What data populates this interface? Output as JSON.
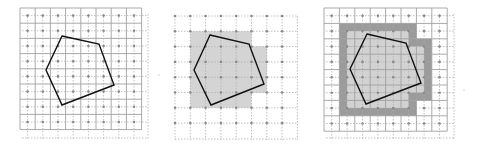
{
  "figure": {
    "colors": {
      "background": "#ffffff",
      "grid_solid": "#9a9a9a",
      "grid_dotted": "#b0b0b0",
      "sample_dot": "#8a8a8a",
      "polygon_stroke": "#111111",
      "fill_light": "#d4d4d4",
      "fill_dark": "#9b9b9b"
    },
    "panels": [
      {
        "id": "panel-1",
        "label": "polygon over grid",
        "origin": [
          20,
          8
        ],
        "cell": 15.2,
        "cols": 8,
        "rows": 8,
        "polygon": [
          [
            62,
            36
          ],
          [
            99,
            44
          ],
          [
            114,
            85
          ],
          [
            62,
            105
          ],
          [
            46,
            70
          ]
        ]
      },
      {
        "id": "panel-2",
        "label": "covered cells shaded",
        "origin": [
          175,
          16
        ],
        "cell": 15.3,
        "cols": 8,
        "rows": 8,
        "polygon": [
          [
            210,
            35
          ],
          [
            249,
            44
          ],
          [
            264,
            84
          ],
          [
            211,
            105
          ],
          [
            194,
            70
          ]
        ]
      },
      {
        "id": "panel-3",
        "label": "covered cells with dilated border",
        "origin": [
          324,
          8
        ],
        "cell": 15.4,
        "cols": 8,
        "rows": 8,
        "polygon": [
          [
            367,
            34
          ],
          [
            406,
            43
          ],
          [
            421,
            83
          ],
          [
            366,
            104
          ],
          [
            350,
            69
          ]
        ]
      }
    ]
  }
}
